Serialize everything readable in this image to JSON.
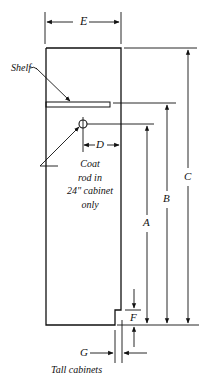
{
  "diagram": {
    "caption": "Tall cabinets",
    "labels": {
      "E": "E",
      "D": "D",
      "A": "A",
      "B": "B",
      "C": "C",
      "F": "F",
      "G": "G"
    },
    "annotations": {
      "shelf": "Shelf",
      "coat_rod_line1": "Coat",
      "coat_rod_line2": "rod in",
      "coat_rod_line3": "24\" cabinet",
      "coat_rod_line4": "only"
    },
    "colors": {
      "line": "#111111",
      "background": "#ffffff"
    }
  }
}
